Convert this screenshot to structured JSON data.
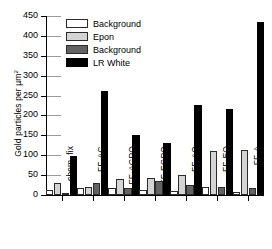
{
  "chart_data": {
    "type": "bar",
    "title": "",
    "xlabel": "",
    "ylabel": "Gold particles per µm",
    "ylabel_sup": "2",
    "ylim": [
      0,
      450
    ],
    "ytick_step": 50,
    "yticks": [
      0,
      50,
      100,
      150,
      200,
      250,
      300,
      350,
      400,
      450
    ],
    "ytick_labels": [
      "0",
      "50",
      "100",
      "150",
      "200",
      "250",
      "300",
      "350",
      "400",
      "450"
    ],
    "grid": false,
    "legend_position": "top-left",
    "categories": [
      "chem. fix",
      "FF-AG",
      "FF-AGPO",
      "FF-EGPO",
      "FF-AO",
      "FF-EO",
      "FF-A"
    ],
    "series": [
      {
        "name": "Background",
        "color": "#ffffff",
        "swatch": "white",
        "values": [
          13,
          17,
          18,
          12,
          10,
          20,
          7
        ]
      },
      {
        "name": "Epon",
        "color": "#d4d4d4",
        "swatch": "lgray",
        "values": [
          29,
          20,
          40,
          43,
          50,
          110,
          112
        ]
      },
      {
        "name": "Background",
        "color": "#636363",
        "swatch": "dgray",
        "values": [
          5,
          31,
          18,
          35,
          24,
          19,
          18
        ]
      },
      {
        "name": "LR White",
        "color": "#000000",
        "swatch": "black",
        "values": [
          97,
          261,
          151,
          130,
          226,
          217,
          436
        ]
      }
    ]
  },
  "legend": {
    "items": [
      {
        "label": "Background",
        "swatch": "white"
      },
      {
        "label": "Epon",
        "swatch": "lgray"
      },
      {
        "label": "Background",
        "swatch": "dgray"
      },
      {
        "label": "LR White",
        "swatch": "black"
      }
    ]
  }
}
